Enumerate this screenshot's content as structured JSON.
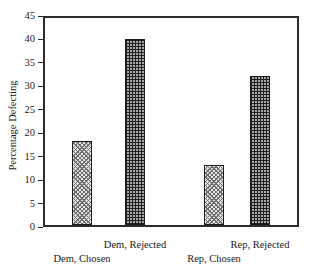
{
  "chart_data": {
    "type": "bar",
    "title": "National Election Studies",
    "title_clipped_at_top": true,
    "categories": [
      "Dem, Chosen",
      "Dem, Rejected",
      "Rep, Chosen",
      "Rep, Rejected"
    ],
    "values": [
      18,
      40,
      13,
      32
    ],
    "xlabel": "",
    "ylabel": "Percentage Defecting",
    "ylim": [
      0,
      45
    ],
    "y_ticks": [
      45,
      40,
      35,
      30,
      25,
      20,
      15,
      10,
      5,
      0
    ],
    "grid": false,
    "legend": "none",
    "bar_patterns": [
      "diagonal-check",
      "fine-grid",
      "diagonal-check",
      "fine-grid"
    ],
    "colors": {
      "background": "#ffffff",
      "frame": "#2b2b2b",
      "text": "#1a1a1a",
      "chosen_pattern_base": "#e3e3e3",
      "chosen_pattern_line": "#6f6f6f",
      "rejected_pattern_base": "#a8a8a8",
      "rejected_pattern_line": "#1f1f1f"
    },
    "layout": {
      "plot_px": {
        "left": 43,
        "top": 16,
        "width": 256,
        "height": 211
      },
      "bar_centers_px": [
        39,
        92,
        171,
        217
      ],
      "bar_width_px": 20,
      "label_rows": [
        "lower",
        "upper",
        "lower",
        "upper"
      ]
    }
  }
}
